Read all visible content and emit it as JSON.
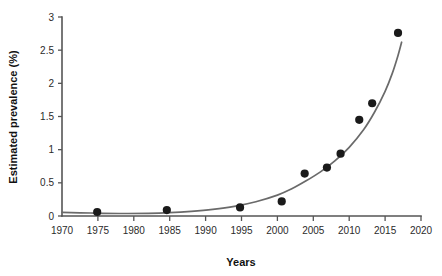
{
  "chart_data": {
    "type": "scatter",
    "title": "",
    "subtitle": "",
    "xlabel": "Years",
    "ylabel": "Estimated prevalence (%)",
    "xlim": [
      1970,
      2020
    ],
    "ylim": [
      0,
      3
    ],
    "grid": false,
    "legend": null,
    "x_ticks": [
      1970,
      1975,
      1980,
      1985,
      1990,
      1995,
      2000,
      2005,
      2010,
      2015,
      2020
    ],
    "x_tick_labels": [
      "1970",
      "1975",
      "1980",
      "1985",
      "1990",
      "1995",
      "2000",
      "2005",
      "2010",
      "2015",
      "2020"
    ],
    "y_ticks": [
      0,
      0.5,
      1,
      1.5,
      2,
      2.5,
      3
    ],
    "y_tick_labels": [
      "0",
      "0.5",
      "1",
      "1.5",
      "2",
      "2.5",
      "3"
    ],
    "series": [
      {
        "name": "Estimated prevalence observations",
        "type": "scatter",
        "marker": "filled-circle",
        "color": "#1a1a1a",
        "points": [
          {
            "x": 1974.9,
            "y": 0.06
          },
          {
            "x": 1984.6,
            "y": 0.09
          },
          {
            "x": 1994.8,
            "y": 0.13
          },
          {
            "x": 2000.6,
            "y": 0.22
          },
          {
            "x": 2003.8,
            "y": 0.64
          },
          {
            "x": 2006.9,
            "y": 0.73
          },
          {
            "x": 2008.8,
            "y": 0.94
          },
          {
            "x": 2011.4,
            "y": 1.45
          },
          {
            "x": 2013.2,
            "y": 1.7
          },
          {
            "x": 2016.8,
            "y": 2.76
          }
        ]
      },
      {
        "name": "Exponential fit curve",
        "type": "line",
        "color": "#6a6a6a",
        "points": [
          {
            "x": 1970.0,
            "y": 0.055
          },
          {
            "x": 1974.0,
            "y": 0.045
          },
          {
            "x": 1978.0,
            "y": 0.038
          },
          {
            "x": 1982.0,
            "y": 0.04
          },
          {
            "x": 1985.0,
            "y": 0.05
          },
          {
            "x": 1988.0,
            "y": 0.07
          },
          {
            "x": 1991.0,
            "y": 0.1
          },
          {
            "x": 1994.0,
            "y": 0.145
          },
          {
            "x": 1997.0,
            "y": 0.215
          },
          {
            "x": 2000.0,
            "y": 0.315
          },
          {
            "x": 2002.0,
            "y": 0.41
          },
          {
            "x": 2004.0,
            "y": 0.53
          },
          {
            "x": 2006.0,
            "y": 0.665
          },
          {
            "x": 2008.0,
            "y": 0.83
          },
          {
            "x": 2010.0,
            "y": 1.035
          },
          {
            "x": 2012.0,
            "y": 1.3
          },
          {
            "x": 2013.5,
            "y": 1.56
          },
          {
            "x": 2015.0,
            "y": 1.88
          },
          {
            "x": 2016.0,
            "y": 2.15
          },
          {
            "x": 2016.8,
            "y": 2.42
          },
          {
            "x": 2017.3,
            "y": 2.62
          }
        ]
      }
    ]
  },
  "axes": {
    "x_title": "Years",
    "y_title": "Estimated prevalence (%)"
  }
}
